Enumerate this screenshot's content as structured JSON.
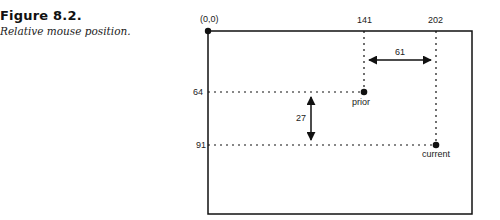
{
  "caption": {
    "title": "Figure 8.2.",
    "subtitle": "Relative mouse position."
  },
  "diagram": {
    "origin_label": "(0,0)",
    "x_labels": {
      "prior_x": "141",
      "current_x": "202"
    },
    "y_labels": {
      "prior_y": "64",
      "current_y": "91"
    },
    "dx_label": "61",
    "dy_label": "27",
    "points": {
      "prior": {
        "label": "prior",
        "x": 141,
        "y": 64
      },
      "current": {
        "label": "current",
        "x": 202,
        "y": 91
      }
    },
    "colors": {
      "line": "#111111",
      "background": "#ffffff"
    }
  }
}
